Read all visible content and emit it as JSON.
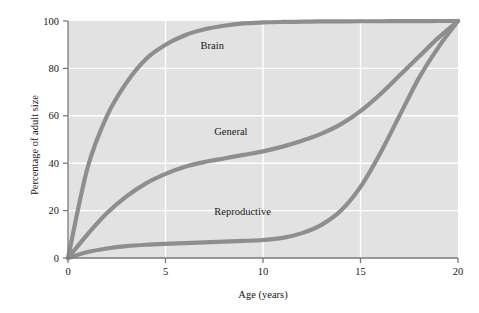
{
  "chart_data": {
    "type": "line",
    "title": "",
    "xlabel": "Age (years)",
    "ylabel": "Percentage of adult size",
    "xlim": [
      0,
      20
    ],
    "ylim": [
      0,
      100
    ],
    "grid": true,
    "grid_color": "#ffffff",
    "plot_background": "#e2e2e2",
    "legend_position": "inline-labels",
    "xticks": [
      0,
      5,
      10,
      15,
      20
    ],
    "xtick_labels": [
      "0",
      "5",
      "10",
      "15",
      "20"
    ],
    "yticks": [
      0,
      20,
      40,
      60,
      80,
      100
    ],
    "ytick_labels": [
      "0",
      "20",
      "40",
      "60",
      "80",
      "100"
    ],
    "series_color": "#8e8e8e",
    "x": [
      0,
      1,
      2,
      3,
      4,
      5,
      6,
      7,
      8,
      9,
      10,
      11,
      12,
      13,
      14,
      15,
      16,
      17,
      18,
      19,
      20
    ],
    "series": [
      {
        "name": "Brain",
        "label": "Brain",
        "label_x": 6.8,
        "label_y": 88,
        "values": [
          0,
          38,
          60,
          74,
          84,
          90,
          94,
          96.5,
          98,
          99,
          99.4,
          99.6,
          99.7,
          99.8,
          99.85,
          99.9,
          99.9,
          99.95,
          99.95,
          100,
          100
        ]
      },
      {
        "name": "General",
        "label": "General",
        "label_x": 7.5,
        "label_y": 52,
        "values": [
          0,
          10,
          19,
          26,
          31.5,
          35.5,
          38.5,
          40.5,
          42,
          43.5,
          45,
          47,
          49.5,
          52.5,
          56.5,
          62,
          69,
          77,
          85,
          93,
          100
        ]
      },
      {
        "name": "Reproductive",
        "label": "Reproductive",
        "label_x": 7.5,
        "label_y": 18,
        "values": [
          0,
          2.5,
          4,
          5,
          5.6,
          6,
          6.3,
          6.6,
          6.9,
          7.2,
          7.6,
          8.5,
          10.5,
          14,
          20,
          30,
          44,
          60,
          76,
          89,
          100
        ]
      }
    ]
  }
}
